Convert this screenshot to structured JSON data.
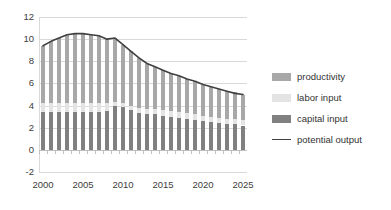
{
  "chart_data": {
    "type": "bar",
    "title": "",
    "subtitle": "",
    "xlabel": "",
    "ylabel": "",
    "stacked": true,
    "grid": true,
    "legend_position": "right",
    "ylim": [
      -2,
      12
    ],
    "yticks": [
      12,
      10,
      8,
      6,
      4,
      2,
      0,
      -2
    ],
    "xlim": [
      2000,
      2025
    ],
    "xticks": [
      2000,
      2005,
      2010,
      2015,
      2020,
      2025
    ],
    "categories": [
      2000,
      2001,
      2002,
      2003,
      2004,
      2005,
      2006,
      2007,
      2008,
      2009,
      2010,
      2011,
      2012,
      2013,
      2014,
      2015,
      2016,
      2017,
      2018,
      2019,
      2020,
      2021,
      2022,
      2023,
      2024,
      2025
    ],
    "series": [
      {
        "name": "capital input",
        "kind": "bar-segment",
        "color": "#808080",
        "values": [
          3.4,
          3.4,
          3.4,
          3.4,
          3.4,
          3.4,
          3.4,
          3.4,
          3.5,
          4.0,
          3.9,
          3.6,
          3.3,
          3.2,
          3.2,
          3.1,
          3.0,
          2.9,
          2.8,
          2.7,
          2.6,
          2.5,
          2.4,
          2.3,
          2.3,
          2.2
        ]
      },
      {
        "name": "labor input",
        "kind": "bar-segment",
        "color": "#e4e4e4",
        "values": [
          0.8,
          0.8,
          0.8,
          0.8,
          0.8,
          0.8,
          0.8,
          0.8,
          0.7,
          0.3,
          0.3,
          0.4,
          0.5,
          0.5,
          0.5,
          0.5,
          0.5,
          0.5,
          0.5,
          0.5,
          0.5,
          0.5,
          0.5,
          0.5,
          0.5,
          0.5
        ]
      },
      {
        "name": "productivity",
        "kind": "bar-segment",
        "color": "#a8a8a8",
        "values": [
          5.2,
          5.6,
          5.9,
          6.2,
          6.3,
          6.3,
          6.2,
          6.1,
          5.8,
          5.8,
          5.3,
          4.9,
          4.5,
          4.1,
          3.8,
          3.6,
          3.4,
          3.3,
          3.1,
          3.0,
          2.8,
          2.7,
          2.6,
          2.5,
          2.4,
          2.3
        ]
      },
      {
        "name": "potential output",
        "kind": "line",
        "color": "#404040",
        "values": [
          9.4,
          9.8,
          10.1,
          10.4,
          10.5,
          10.5,
          10.4,
          10.3,
          10.0,
          10.1,
          9.5,
          8.9,
          8.3,
          7.8,
          7.5,
          7.2,
          6.9,
          6.7,
          6.4,
          6.2,
          5.9,
          5.7,
          5.5,
          5.3,
          5.1,
          5.0
        ]
      }
    ]
  },
  "legend": {
    "items": [
      {
        "label": "productivity",
        "swatch": "#a8a8a8",
        "marker": "swatch"
      },
      {
        "label": "labor input",
        "swatch": "#e4e4e4",
        "marker": "swatch"
      },
      {
        "label": "capital input",
        "swatch": "#808080",
        "marker": "swatch"
      },
      {
        "label": "potential output",
        "swatch": "#404040",
        "marker": "line"
      }
    ]
  }
}
